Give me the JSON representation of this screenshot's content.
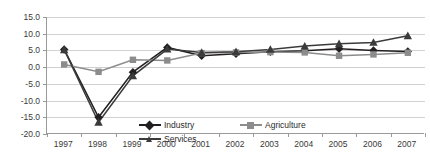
{
  "chart_data": {
    "type": "line",
    "title": "",
    "xlabel": "",
    "ylabel": "",
    "x": [
      1997,
      1998,
      1999,
      2000,
      2001,
      2002,
      2003,
      2004,
      2005,
      2006,
      2007
    ],
    "categories": [
      "1997",
      "1998",
      "1999",
      "2000",
      "2001",
      "2002",
      "2003",
      "2004",
      "2005",
      "2006",
      "2007"
    ],
    "series": [
      {
        "name": "Industry",
        "marker": "diamond",
        "color": "#231f20",
        "values": [
          5.3,
          -15.0,
          -1.5,
          5.9,
          3.4,
          4.0,
          4.6,
          4.9,
          5.5,
          5.0,
          4.7
        ]
      },
      {
        "name": "Agriculture",
        "marker": "square",
        "color": "#8c8c8c",
        "values": [
          0.8,
          -1.4,
          2.2,
          2.0,
          4.2,
          4.4,
          4.5,
          4.4,
          3.4,
          3.8,
          4.3
        ]
      },
      {
        "name": "Services",
        "marker": "triangle",
        "color": "#3b3b3b",
        "values": [
          5.2,
          -16.5,
          -2.6,
          5.4,
          4.4,
          4.6,
          5.3,
          6.3,
          7.0,
          7.4,
          9.4
        ]
      }
    ],
    "ylim": [
      -20.0,
      15.0
    ],
    "ytick_step": 5.0,
    "yticks": [
      "15.0",
      "10.0",
      "5.0",
      "0.0",
      "-5.0",
      "-10.0",
      "-15.0",
      "-20.0"
    ],
    "ytick_values": [
      15.0,
      10.0,
      5.0,
      0.0,
      -5.0,
      -10.0,
      -15.0,
      -20.0
    ],
    "grid": true,
    "legend_position": "bottom-center",
    "legend": [
      "Industry",
      "Agriculture",
      "Services"
    ]
  },
  "colors": {
    "industry": "#231f20",
    "agriculture": "#8c8c8c",
    "services": "#3b3b3b",
    "grid": "#d2d2d2",
    "axis": "#9a9a9a",
    "text": "#3a3a3a",
    "background": "#ffffff"
  }
}
